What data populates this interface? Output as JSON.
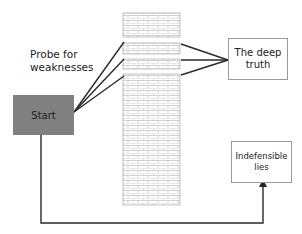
{
  "diagram": {
    "probe_label": "Probe for weaknesses",
    "start_node": {
      "label": "Start",
      "fill": "#808080"
    },
    "truth_node": {
      "label": "The deep truth"
    },
    "lies_node": {
      "label": "Indefensible lies"
    },
    "wall": {
      "description": "brick wall barrier",
      "fill": "#ffffff",
      "mortar_color": "#b0b0b0",
      "gaps": 3
    },
    "colors": {
      "line": "#333333",
      "box_border": "#9a9a9a",
      "text": "#222222"
    }
  }
}
